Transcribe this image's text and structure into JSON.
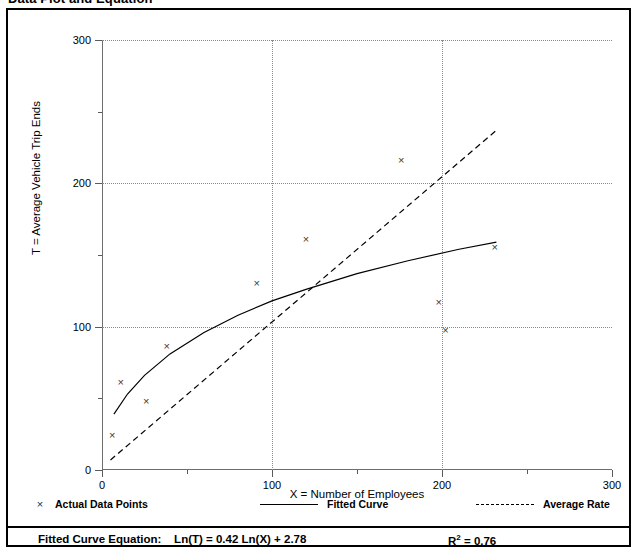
{
  "figure": {
    "title": "Data Plot and Equation"
  },
  "legend": [
    {
      "key": "points",
      "label": "Actual Data Points",
      "marker": "x-marker-icon"
    },
    {
      "key": "fitted",
      "label": "Fitted Curve",
      "marker": "solid-line-icon"
    },
    {
      "key": "average",
      "label": "Average Rate",
      "marker": "dashed-line-icon"
    }
  ],
  "footer": {
    "equation_label": "Fitted Curve Equation:",
    "equation": "Ln(T) = 0.42 Ln(X) + 2.78",
    "r_squared_label": "R",
    "r_squared_exp": "2",
    "r_squared_value": "= 0.76"
  },
  "chart_data": {
    "type": "scatter",
    "title": "Data Plot and Equation",
    "xlabel": "X = Number of Employees",
    "ylabel": "T = Average Vehicle Trip Ends",
    "xlim": [
      0,
      300
    ],
    "ylim": [
      0,
      300
    ],
    "xticks": [
      0,
      100,
      200,
      300
    ],
    "yticks": [
      0,
      100,
      200,
      300
    ],
    "xticks_minor": [
      50,
      150,
      250
    ],
    "yticks_minor": [
      50,
      150,
      250
    ],
    "xticklabels": [
      "0",
      "100",
      "200",
      "300"
    ],
    "yticklabels": [
      "0",
      "100",
      "200",
      "300"
    ],
    "grid": true,
    "grid_style": "dotted",
    "legend_position": "below-axes",
    "series": [
      {
        "name": "Actual Data Points",
        "type": "scatter",
        "marker": "x",
        "color": "#3a3a3a",
        "points": [
          {
            "x": 6,
            "y": 24
          },
          {
            "x": 11,
            "y": 61
          },
          {
            "x": 26,
            "y": 48
          },
          {
            "x": 38,
            "y": 86
          },
          {
            "x": 91,
            "y": 130
          },
          {
            "x": 120,
            "y": 161
          },
          {
            "x": 176,
            "y": 216
          },
          {
            "x": 198,
            "y": 117
          },
          {
            "x": 202,
            "y": 97
          },
          {
            "x": 231,
            "y": 155
          }
        ]
      },
      {
        "name": "Fitted Curve",
        "type": "line",
        "style": "solid",
        "color": "#000000",
        "equation": "Ln(T) = 0.42 Ln(X) + 2.78",
        "r_squared": 0.76,
        "points": [
          {
            "x": 7,
            "y": 39
          },
          {
            "x": 15,
            "y": 53
          },
          {
            "x": 25,
            "y": 66
          },
          {
            "x": 40,
            "y": 81
          },
          {
            "x": 60,
            "y": 96
          },
          {
            "x": 80,
            "y": 108
          },
          {
            "x": 100,
            "y": 118
          },
          {
            "x": 120,
            "y": 126
          },
          {
            "x": 150,
            "y": 137
          },
          {
            "x": 180,
            "y": 146
          },
          {
            "x": 210,
            "y": 154
          },
          {
            "x": 232,
            "y": 159
          }
        ]
      },
      {
        "name": "Average Rate",
        "type": "line",
        "style": "dashed",
        "color": "#000000",
        "points": [
          {
            "x": 5,
            "y": 7
          },
          {
            "x": 232,
            "y": 237
          }
        ]
      }
    ]
  }
}
